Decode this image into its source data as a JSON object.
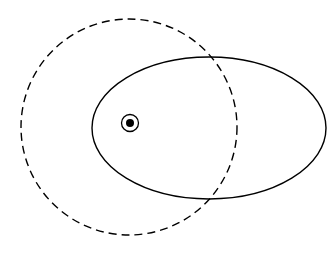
{
  "canvas": {
    "width": 334,
    "height": 254,
    "background_color": "#ffffff",
    "stroke_color": "#000000"
  },
  "diagram": {
    "shapes": [
      {
        "name": "dashed-circle",
        "type": "circle",
        "style": "dashed",
        "cx": 129,
        "cy": 127,
        "r": 108,
        "stroke_color": "#000000",
        "stroke_width": 1.4,
        "dash_length": 8,
        "gap_length": 5,
        "bounds": {
          "left": 21,
          "right": 237,
          "top": 19,
          "bottom": 235
        }
      },
      {
        "name": "solid-ellipse",
        "type": "ellipse",
        "style": "solid",
        "cx": 209,
        "cy": 128,
        "rx": 117,
        "ry": 71,
        "stroke_color": "#000000",
        "stroke_width": 1.4,
        "bounds": {
          "left": 92,
          "right": 326,
          "top": 57,
          "bottom": 199
        }
      },
      {
        "name": "focus-point-marker",
        "type": "point-marker",
        "cx": 130,
        "cy": 123,
        "ring_radius": 8.5,
        "dot_radius": 4,
        "ring_stroke_width": 1.3,
        "stroke_color": "#000000",
        "fill_color": "#000000"
      }
    ],
    "intersections": [
      {
        "name": "upper-intersection",
        "x": 217,
        "y": 58
      },
      {
        "name": "lower-intersection",
        "x": 212,
        "y": 197
      }
    ]
  },
  "chart_data": {
    "type": "scatter",
    "xlabel": "",
    "ylabel": "",
    "xlim": [
      0,
      334
    ],
    "ylim": [
      0,
      254
    ],
    "grid": false,
    "legend": "none",
    "series": [
      {
        "name": "dashed circle",
        "shape": "circle",
        "linestyle": "dashed",
        "center": [
          129,
          127
        ],
        "radius": 108
      },
      {
        "name": "solid ellipse",
        "shape": "ellipse",
        "linestyle": "solid",
        "center": [
          209,
          128
        ],
        "semi_axes": [
          117,
          71
        ]
      },
      {
        "name": "focus point",
        "shape": "point",
        "linestyle": "solid",
        "center": [
          130,
          123
        ],
        "marker": "circled-dot"
      }
    ],
    "annotations": []
  }
}
